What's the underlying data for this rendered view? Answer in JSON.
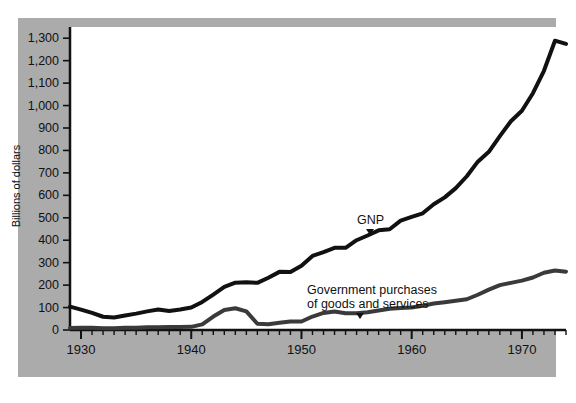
{
  "chart_data": {
    "type": "line",
    "title": "",
    "subtitle": "",
    "xlabel": "",
    "ylabel": "Billions of dollars",
    "xlim": [
      1929,
      1974
    ],
    "ylim": [
      0,
      1350
    ],
    "grid": false,
    "legend_position": "inline-annotations",
    "ytick_labels": [
      "1,300",
      "1,200",
      "1,100",
      "1,000",
      "900",
      "800",
      "700",
      "600",
      "500",
      "400",
      "300",
      "200",
      "100",
      "0"
    ],
    "ytick_values": [
      1300,
      1200,
      1100,
      1000,
      900,
      800,
      700,
      600,
      500,
      400,
      300,
      200,
      100,
      0
    ],
    "xtick_labels": [
      "1930",
      "1940",
      "1950",
      "1960",
      "1970"
    ],
    "xtick_values": [
      1930,
      1940,
      1950,
      1960,
      1970
    ],
    "minor_xticks_every": 1,
    "x": [
      1929,
      1930,
      1931,
      1932,
      1933,
      1934,
      1935,
      1936,
      1937,
      1938,
      1939,
      1940,
      1941,
      1942,
      1943,
      1944,
      1945,
      1946,
      1947,
      1948,
      1949,
      1950,
      1951,
      1952,
      1953,
      1954,
      1955,
      1956,
      1957,
      1958,
      1959,
      1960,
      1961,
      1962,
      1963,
      1964,
      1965,
      1966,
      1967,
      1968,
      1969,
      1970,
      1971,
      1972,
      1973,
      1974
    ],
    "series": [
      {
        "name": "GNP",
        "label": "GNP",
        "color": "#111111",
        "linewidth": 4,
        "values": [
          104,
          91,
          76,
          59,
          56,
          65,
          73,
          83,
          91,
          85,
          91,
          100,
          125,
          158,
          192,
          211,
          213,
          210,
          233,
          259,
          258,
          286,
          330,
          347,
          366,
          366,
          400,
          421,
          444,
          449,
          487,
          504,
          520,
          560,
          591,
          632,
          685,
          750,
          794,
          864,
          930,
          977,
          1055,
          1155,
          1289,
          1275
        ]
      },
      {
        "name": "Government purchases of goods and services",
        "label": "Government purchases\nof goods and services",
        "label_line1": "Government purchases",
        "label_line2": "of goods and services",
        "color": "#3a3a3a",
        "linewidth": 4,
        "values": [
          9,
          10,
          10,
          8,
          8,
          10,
          10,
          12,
          12,
          13,
          13,
          14,
          25,
          60,
          89,
          97,
          83,
          28,
          26,
          32,
          38,
          38,
          60,
          76,
          82,
          75,
          75,
          79,
          87,
          95,
          98,
          100,
          108,
          118,
          124,
          130,
          137,
          157,
          180,
          200,
          210,
          220,
          234,
          255,
          265,
          260
        ]
      }
    ],
    "annotations": [
      {
        "text": "GNP",
        "series": "GNP",
        "year": 1957,
        "pointer": "down"
      },
      {
        "text": "Government purchases of goods and services",
        "series": "Government purchases of goods and services",
        "year": 1956,
        "pointer": "down"
      }
    ],
    "colors": {
      "panel_background": "#ababab",
      "plot_background": "#ffffff",
      "axis": "#111111",
      "gnp_line": "#111111",
      "government_line": "#3a3a3a",
      "text": "#111111"
    }
  }
}
